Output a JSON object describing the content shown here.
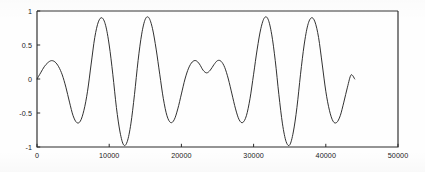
{
  "chart_data": {
    "type": "line",
    "title": "",
    "subtitle": "",
    "xlabel": "",
    "ylabel": "",
    "xlim": [
      0,
      50000
    ],
    "ylim": [
      -1,
      1
    ],
    "grid": false,
    "legend": null,
    "x_ticks": [
      0,
      10000,
      20000,
      30000,
      40000,
      50000
    ],
    "x_tick_labels": [
      "0",
      "10000",
      "20000",
      "30000",
      "40000",
      "50000"
    ],
    "y_ticks": [
      1,
      0.5,
      0,
      -0.5,
      -1
    ],
    "y_tick_labels": [
      "1",
      "0.5",
      "0",
      "-0.5",
      "-1"
    ],
    "series": [
      {
        "name": "signal",
        "color": "#262626",
        "x_start": 0,
        "x_end": 44000,
        "description": "amplitude-modulated beat waveform",
        "envelope_peaks_x": [
          8000,
          14000,
          30000,
          36000
        ],
        "envelope_peak_value": 0.9,
        "node_x": 22000,
        "node_peak_value": 0.27,
        "trough_minimum_value": -1.0,
        "trough_minimum_x": [
          11000,
          33000
        ],
        "x": [
          0,
          500,
          1000,
          1500,
          2000,
          2500,
          3000,
          3500,
          4000,
          4500,
          5000,
          5500,
          6000,
          6500,
          7000,
          7500,
          8000,
          8500,
          9000,
          9500,
          10000,
          10500,
          11000,
          11500,
          12000,
          12500,
          13000,
          13500,
          14000,
          14500,
          15000,
          15500,
          16000,
          16500,
          17000,
          17500,
          18000,
          18500,
          19000,
          19500,
          20000,
          20500,
          21000,
          21500,
          22000,
          22500,
          23000,
          23500,
          24000,
          24500,
          25000,
          25500,
          26000,
          26500,
          27000,
          27500,
          28000,
          28500,
          29000,
          29500,
          30000,
          30500,
          31000,
          31500,
          32000,
          32500,
          33000,
          33500,
          34000,
          34500,
          35000,
          35500,
          36000,
          36500,
          37000,
          37500,
          38000,
          38500,
          39000,
          39500,
          40000,
          40500,
          41000,
          41500,
          42000,
          42500,
          43000,
          43500,
          44000
        ],
        "y": [
          0.0,
          0.09,
          0.18,
          0.24,
          0.27,
          0.25,
          0.18,
          0.06,
          -0.12,
          -0.34,
          -0.54,
          -0.64,
          -0.62,
          -0.46,
          -0.18,
          0.22,
          0.61,
          0.84,
          0.9,
          0.79,
          0.5,
          0.07,
          -0.42,
          -0.78,
          -0.97,
          -0.92,
          -0.66,
          -0.23,
          0.27,
          0.66,
          0.88,
          0.9,
          0.74,
          0.44,
          0.07,
          -0.29,
          -0.54,
          -0.64,
          -0.6,
          -0.44,
          -0.22,
          0.0,
          0.16,
          0.25,
          0.27,
          0.22,
          0.13,
          0.09,
          0.13,
          0.21,
          0.27,
          0.26,
          0.17,
          0.0,
          -0.22,
          -0.44,
          -0.6,
          -0.64,
          -0.54,
          -0.29,
          0.07,
          0.44,
          0.74,
          0.9,
          0.88,
          0.66,
          0.27,
          -0.23,
          -0.66,
          -0.92,
          -0.97,
          -0.78,
          -0.42,
          0.07,
          0.5,
          0.79,
          0.9,
          0.84,
          0.61,
          0.22,
          -0.18,
          -0.46,
          -0.62,
          -0.64,
          -0.54,
          -0.34,
          -0.12,
          0.06,
          0.0
        ]
      }
    ]
  },
  "figure": {
    "axis_color": "#2a2a2a",
    "curve_color": "#262626",
    "background": "#ffffff"
  }
}
